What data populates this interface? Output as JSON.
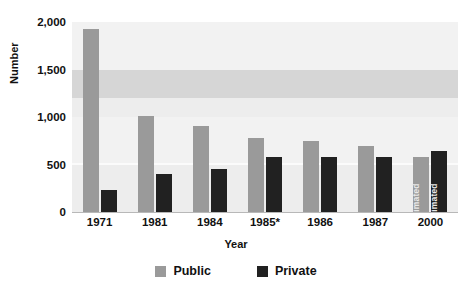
{
  "chart_data": {
    "type": "bar",
    "title": "",
    "xlabel": "Year",
    "ylabel": "Number",
    "categories": [
      "1971",
      "1981",
      "1984",
      "1985*",
      "1986",
      "1987",
      "2000"
    ],
    "series": [
      {
        "name": "Public",
        "color": "#9a9a9a",
        "values": [
          1925,
          1010,
          905,
          780,
          750,
          700,
          580
        ]
      },
      {
        "name": "Private",
        "color": "#212121",
        "values": [
          235,
          400,
          450,
          580,
          580,
          580,
          640
        ]
      }
    ],
    "ylim": [
      0,
      2000
    ],
    "yticks": [
      0,
      500,
      1000,
      1500,
      2000
    ],
    "ytick_labels": [
      "0",
      "500",
      "1,000",
      "1,500",
      "2,000"
    ],
    "grid": false,
    "background_bands": true,
    "legend_position": "bottom",
    "annotations": [
      {
        "category": "2000",
        "series": "Public",
        "text": "estimated",
        "rotation": -90
      },
      {
        "category": "2000",
        "series": "Private",
        "text": "estimated",
        "rotation": -90
      }
    ]
  },
  "axes": {
    "y_title": "Number",
    "x_title": "Year"
  },
  "legend": {
    "items": [
      {
        "label": "Public",
        "color": "#9a9a9a"
      },
      {
        "label": "Private",
        "color": "#212121"
      }
    ]
  },
  "colors": {
    "public": "#9a9a9a",
    "private": "#212121",
    "band_mid": "#d6d6d6",
    "band_pale": "#ededed",
    "band_light": "#f2f2f2",
    "axis": "#b8b8b8",
    "text": "#111111"
  }
}
